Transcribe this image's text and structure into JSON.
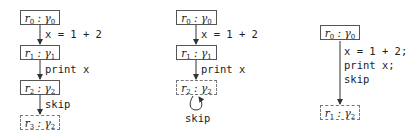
{
  "diagrams": [
    {
      "nodes": [
        {
          "r": "r",
          "ri": "0",
          "g": "γ",
          "gi": "0",
          "style": "solid"
        },
        {
          "r": "r",
          "ri": "1",
          "g": "γ",
          "gi": "1",
          "style": "solid"
        },
        {
          "r": "r",
          "ri": "2",
          "g": "γ",
          "gi": "2",
          "style": "solid"
        },
        {
          "r": "r",
          "ri": "3",
          "g": "γ",
          "gi": "2",
          "style": "dashed"
        }
      ],
      "edges": [
        "x = 1 + 2",
        "print x",
        "skip"
      ]
    },
    {
      "nodes": [
        {
          "r": "r",
          "ri": "0",
          "g": "γ",
          "gi": "0",
          "style": "solid"
        },
        {
          "r": "r",
          "ri": "1",
          "g": "γ",
          "gi": "1",
          "style": "solid"
        },
        {
          "r": "r",
          "ri": "2",
          "g": "γ",
          "gi": "2",
          "style": "dashed"
        }
      ],
      "edges": [
        "x = 1 + 2",
        "print x"
      ],
      "self_loop": "skip"
    },
    {
      "nodes": [
        {
          "r": "r",
          "ri": "0",
          "g": "γ",
          "gi": "0",
          "style": "solid"
        },
        {
          "r": "r",
          "ri": "1",
          "g": "γ",
          "gi": "2",
          "style": "dashed"
        }
      ],
      "edges": [
        "x = 1 + 2;",
        "print x;",
        "skip"
      ]
    }
  ]
}
